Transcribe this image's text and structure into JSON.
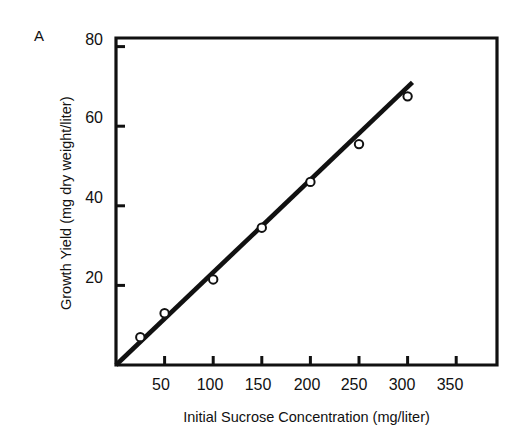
{
  "figure": {
    "panel_label": "A",
    "background_color": "#ffffff",
    "ink_color": "#111111"
  },
  "chart_data": {
    "type": "scatter",
    "title": "",
    "panel": "A",
    "xlabel": "Initial Sucrose Concentration (mg/liter)",
    "ylabel": "Growth Yield (mg dry weight/liter)",
    "xlim": [
      0,
      380
    ],
    "ylim": [
      0,
      80
    ],
    "xticks": [
      50,
      100,
      150,
      200,
      250,
      300,
      350
    ],
    "xtick_labels": [
      "50",
      "100",
      "150",
      "200",
      "250",
      "300",
      "350"
    ],
    "yticks": [
      20,
      40,
      60,
      80
    ],
    "ytick_labels": [
      "20",
      "40",
      "60",
      "80"
    ],
    "grid": false,
    "legend": null,
    "marker": "open-circle",
    "x": [
      25,
      50,
      100,
      150,
      200,
      250,
      300
    ],
    "y": [
      7,
      13,
      21.5,
      34.5,
      46,
      55.5,
      67.5
    ],
    "points": [
      {
        "x": 25,
        "y": 7
      },
      {
        "x": 50,
        "y": 13
      },
      {
        "x": 100,
        "y": 21.5
      },
      {
        "x": 150,
        "y": 34.5
      },
      {
        "x": 200,
        "y": 46
      },
      {
        "x": 250,
        "y": 55.5
      },
      {
        "x": 300,
        "y": 67.5
      }
    ],
    "series": [
      {
        "name": "Growth yield",
        "marker": "open-circle",
        "x": [
          25,
          50,
          100,
          150,
          200,
          250,
          300
        ],
        "values": [
          7,
          13,
          21.5,
          34.5,
          46,
          55.5,
          67.5
        ]
      }
    ],
    "fit_line": {
      "type": "line",
      "x": [
        0,
        305
      ],
      "y": [
        0,
        71
      ],
      "slope": 0.2328,
      "intercept": 0
    }
  },
  "axes": {
    "y_tick_labels": [
      "80",
      "60",
      "40",
      "20"
    ],
    "x_tick_labels": [
      "50",
      "100",
      "150",
      "200",
      "250",
      "300",
      "350"
    ]
  }
}
